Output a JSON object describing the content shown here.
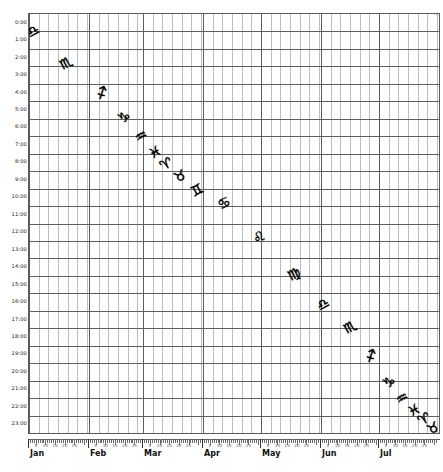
{
  "chart_data": {
    "type": "scatter",
    "title": "",
    "xlabel": "",
    "ylabel": "",
    "grid": true,
    "legend": "none",
    "xlim": [
      "Jan 1",
      "Jul 31"
    ],
    "ylim": [
      0,
      23
    ],
    "x_categories": [
      "Jan",
      "Feb",
      "Mar",
      "Apr",
      "May",
      "Jun",
      "Jul"
    ],
    "x_minor_tick_labels": [
      "5",
      "10",
      "15",
      "20",
      "25"
    ],
    "y_tick_labels": [
      "0:00",
      "1:00",
      "2:00",
      "3:00",
      "4:00",
      "5:00",
      "6:00",
      "7:00",
      "8:00",
      "9:00",
      "10:00",
      "11:00",
      "12:00",
      "13:00",
      "14:00",
      "15:00",
      "16:00",
      "17:00",
      "18:00",
      "19:00",
      "20:00",
      "21:00",
      "22:00",
      "23:00"
    ],
    "y_values": [
      0,
      1,
      2,
      3,
      4,
      5,
      6,
      7,
      8,
      9,
      10,
      11,
      12,
      13,
      14,
      15,
      16,
      17,
      18,
      19,
      20,
      21,
      22,
      23
    ],
    "band_color": "#e3e3e3",
    "grid_color": "#5f5f5f",
    "series": [
      {
        "name": "zodiac-transit-upper",
        "points": [
          {
            "label": "Libra",
            "glyph": "♎",
            "month": "Jan",
            "day": 3,
            "hour": 0.5
          },
          {
            "label": "Scorpio",
            "glyph": "♏",
            "month": "Jan",
            "day": 20,
            "hour": 2.3
          },
          {
            "label": "Sagittarius",
            "glyph": "♐",
            "month": "Feb",
            "day": 8,
            "hour": 4.0
          },
          {
            "label": "Capricorn",
            "glyph": "♑",
            "month": "Feb",
            "day": 19,
            "hour": 5.4
          },
          {
            "label": "Aquarius",
            "glyph": "♒",
            "month": "Feb",
            "day": 28,
            "hour": 6.5
          },
          {
            "label": "Pisces",
            "glyph": "♓",
            "month": "Mar",
            "day": 7,
            "hour": 7.4
          },
          {
            "label": "Aries",
            "glyph": "♈",
            "month": "Mar",
            "day": 13,
            "hour": 8.1
          },
          {
            "label": "Taurus",
            "glyph": "♉",
            "month": "Mar",
            "day": 20,
            "hour": 8.8
          },
          {
            "label": "Gemini",
            "glyph": "♊",
            "month": "Mar",
            "day": 29,
            "hour": 9.6
          },
          {
            "label": "Cancer",
            "glyph": "♋",
            "month": "Apr",
            "day": 12,
            "hour": 10.3
          },
          {
            "label": "Leo",
            "glyph": "♌",
            "month": "Apr",
            "day": 30,
            "hour": 12.3
          },
          {
            "label": "Virgo",
            "glyph": "♍",
            "month": "May",
            "day": 18,
            "hour": 14.4
          },
          {
            "label": "Libra",
            "glyph": "♎",
            "month": "Jun",
            "day": 2,
            "hour": 16.1
          }
        ]
      },
      {
        "name": "zodiac-transit-lower",
        "points": [
          {
            "label": "Scorpio",
            "glyph": "♏",
            "month": "Jun",
            "day": 16,
            "hour": 17.4
          },
          {
            "label": "Sagittarius",
            "glyph": "♐",
            "month": "Jun",
            "day": 27,
            "hour": 19.1
          },
          {
            "label": "Capricorn",
            "glyph": "♑",
            "month": "Jul",
            "day": 6,
            "hour": 20.6
          },
          {
            "label": "Aquarius",
            "glyph": "♒",
            "month": "Jul",
            "day": 13,
            "hour": 21.5
          },
          {
            "label": "Pisces",
            "glyph": "♓",
            "month": "Jul",
            "day": 19,
            "hour": 22.2
          },
          {
            "label": "Aries",
            "glyph": "♈",
            "month": "Jul",
            "day": 24,
            "hour": 22.7
          },
          {
            "label": "Taurus",
            "glyph": "♉",
            "month": "Jul",
            "day": 29,
            "hour": 23.2
          }
        ]
      }
    ]
  }
}
